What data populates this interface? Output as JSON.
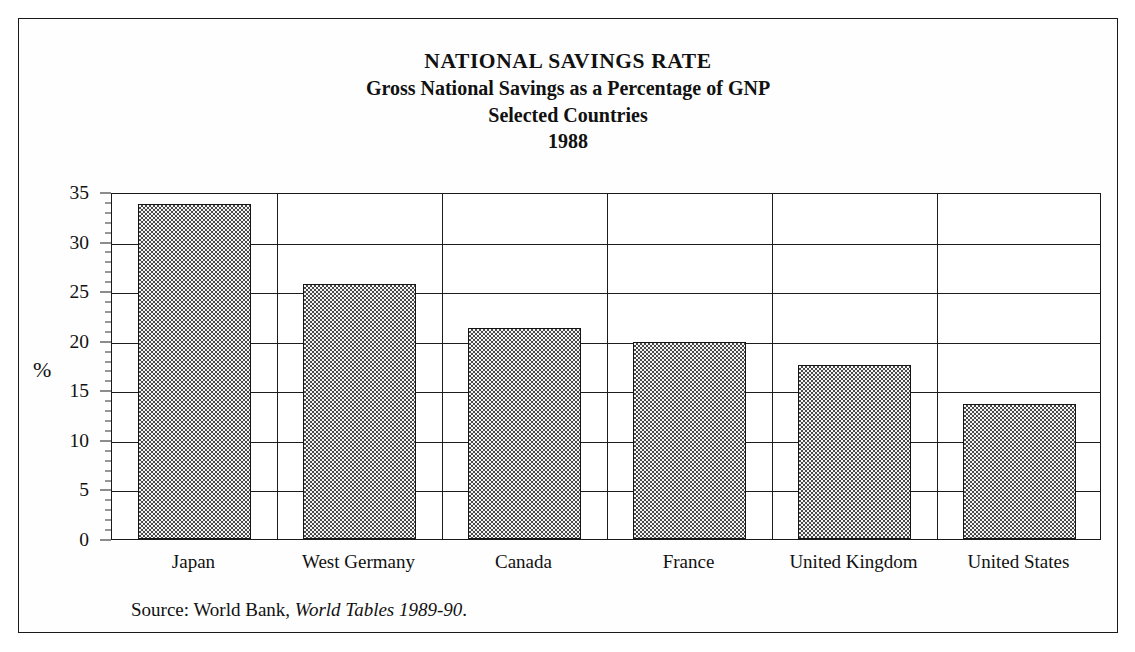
{
  "figure": {
    "title": "NATIONAL SAVINGS RATE",
    "subtitle": "Gross National Savings as a Percentage of GNP",
    "subtitle2": "Selected Countries",
    "year": "1988",
    "source_prefix": "Source: World Bank,",
    "source_italic": "World Tables 1989-90",
    "source_suffix": ".",
    "frame_color": "#1a1a1a",
    "bar_fill_color": "#4a4a4a",
    "bar_edge_color": "#151515",
    "background_color": "#ffffff"
  },
  "chart_data": {
    "type": "bar",
    "title": "NATIONAL SAVINGS RATE",
    "subtitle": "Gross National Savings as a Percentage of GNP / Selected Countries / 1988",
    "categories": [
      "Japan",
      "West Germany",
      "Canada",
      "France",
      "United Kingdom",
      "United States"
    ],
    "values": [
      33.8,
      25.7,
      21.3,
      19.9,
      17.6,
      13.6
    ],
    "xlabel": "",
    "ylabel": "%",
    "ylim": [
      0,
      35
    ],
    "ytick_labels": [
      "0",
      "5",
      "10",
      "15",
      "20",
      "25",
      "30",
      "35"
    ],
    "ytick_values": [
      0,
      5,
      10,
      15,
      20,
      25,
      30,
      35
    ],
    "yminor_interval": 1,
    "grid": "horizontal-and-vertical",
    "legend": "none",
    "annotations": [
      "Source: World Bank, World Tables 1989-90."
    ]
  }
}
